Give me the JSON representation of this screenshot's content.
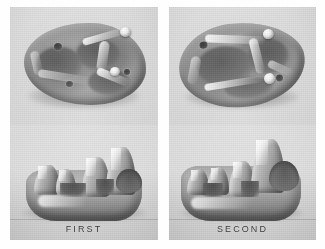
{
  "plate": {
    "background_color": "#ffffff",
    "panel_background_color": "#d2d2d2",
    "ink_color": "#3a3a3a",
    "panel_count": 2
  },
  "panels": [
    {
      "id": "first",
      "caption": "FIRST",
      "views": [
        {
          "id": "occlusal",
          "name": "occlusal-view",
          "description": "crown surface seen from above"
        },
        {
          "id": "lateral",
          "name": "lateral-view",
          "description": "side profile showing cusps"
        }
      ]
    },
    {
      "id": "second",
      "caption": "SECOND",
      "views": [
        {
          "id": "occlusal",
          "name": "occlusal-view",
          "description": "crown surface seen from above"
        },
        {
          "id": "lateral",
          "name": "lateral-view",
          "description": "side profile showing cusps"
        }
      ]
    }
  ]
}
